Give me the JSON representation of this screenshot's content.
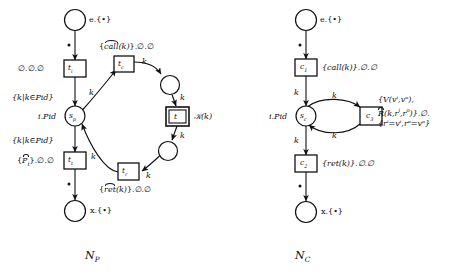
{
  "figure": {
    "caption_left": "N",
    "caption_left_sub": "P",
    "caption_right": "N",
    "caption_right_sub": "C"
  },
  "colors": {
    "stroke": "#111111",
    "background": "#ffffff",
    "text": "#111111"
  },
  "producer_net": {
    "name": "N_P",
    "places": [
      {
        "id": "e",
        "label": "e.{•}",
        "shape": "circle"
      },
      {
        "id": "sp",
        "label": "i.Pid",
        "inner": "s",
        "inner_sub": "p",
        "shape": "circle"
      },
      {
        "id": "x",
        "label": "x.{•}",
        "shape": "circle"
      },
      {
        "id": "mid_top",
        "label": "",
        "shape": "circle"
      },
      {
        "id": "mid_bot",
        "label": "",
        "shape": "circle"
      }
    ],
    "transitions": [
      {
        "id": "ti",
        "inner": "t",
        "inner_sub": "i",
        "annotation": "∅.∅.∅",
        "double": false
      },
      {
        "id": "tc",
        "inner": "t",
        "inner_sub": "c",
        "annotation_pre": "{",
        "annotation_hat": "call",
        "annotation_post": "(k)}.∅.∅",
        "double": false
      },
      {
        "id": "t",
        "inner": "t",
        "inner_sub": "",
        "annotation": "ℬ(k)",
        "annotation_display": "K(k)",
        "double": true
      },
      {
        "id": "tr",
        "inner": "t",
        "inner_sub": "r",
        "annotation_pre": "{",
        "annotation_hat": "ret",
        "annotation_post": "(k)}.∅.∅",
        "double": false
      },
      {
        "id": "tt",
        "inner": "t",
        "inner_sub": "t",
        "annotation_pre": "{",
        "annotation_hat": "P",
        "annotation_hat_sub": "t",
        "annotation_post": "}.∅.∅",
        "double": false
      }
    ],
    "arc_labels": [
      {
        "id": "ti-sp",
        "text": "{k|k∈Pid}"
      },
      {
        "id": "sp-tc",
        "text": "k"
      },
      {
        "id": "tc-mid",
        "text": "k"
      },
      {
        "id": "mid-t",
        "text": "k"
      },
      {
        "id": "t-midbot",
        "text": "k"
      },
      {
        "id": "midbot-tr",
        "text": "k"
      },
      {
        "id": "tr-sp",
        "text": "k"
      },
      {
        "id": "sp-tt",
        "text": "{k|k∈Pid}"
      }
    ],
    "tokens": [
      {
        "id": "e-token",
        "symbol": "•"
      },
      {
        "id": "x-token",
        "symbol": "•"
      }
    ]
  },
  "consumer_net": {
    "name": "N_C",
    "places": [
      {
        "id": "e",
        "label": "e.{•}",
        "shape": "circle"
      },
      {
        "id": "sc",
        "label": "i.Pid",
        "inner": "s",
        "inner_sub": "c",
        "shape": "circle"
      },
      {
        "id": "x",
        "label": "x.{•}",
        "shape": "circle"
      }
    ],
    "transitions": [
      {
        "id": "c1",
        "inner": "c",
        "inner_sub": "1",
        "annotation": "{call(k)}.∅.∅",
        "double": false
      },
      {
        "id": "c3",
        "inner": "c",
        "inner_sub": "3",
        "double": false,
        "annotation_lines": [
          "{V(vⁱ,vᵒ),",
          "R̂(k,rⁱ,rᵒ)}.∅.",
          "{rⁱ=vⁱ,rᵒ=vᵒ}"
        ]
      },
      {
        "id": "c2",
        "inner": "c",
        "inner_sub": "2",
        "annotation": "{ret(k)}.∅.∅",
        "double": false
      }
    ],
    "arc_labels": [
      {
        "id": "c1-sc",
        "text": "k"
      },
      {
        "id": "sc-c3",
        "text": "k"
      },
      {
        "id": "c3-sc",
        "text": "k"
      },
      {
        "id": "sc-c2",
        "text": "k"
      }
    ],
    "tokens": [
      {
        "id": "e-token",
        "symbol": "•"
      },
      {
        "id": "x-token",
        "symbol": "•"
      }
    ]
  }
}
